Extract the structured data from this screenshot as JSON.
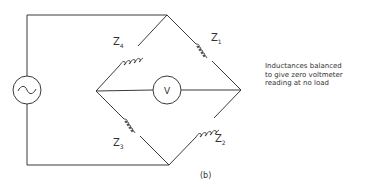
{
  "diagram": {
    "type": "inductance bridge circuit",
    "source": {
      "symbol": "~",
      "icon": "ac-source-icon"
    },
    "meter": {
      "label": "V",
      "icon": "voltmeter-icon"
    },
    "impedances": [
      {
        "name": "Z",
        "sub": "1",
        "position": "upper-right arm"
      },
      {
        "name": "Z",
        "sub": "2",
        "position": "lower-right arm"
      },
      {
        "name": "Z",
        "sub": "3",
        "position": "lower-left arm"
      },
      {
        "name": "Z",
        "sub": "4",
        "position": "upper-left arm"
      }
    ],
    "note_lines": [
      "Inductances balanced",
      "to give zero voltmeter",
      "reading at no load"
    ],
    "caption": "(b)"
  }
}
